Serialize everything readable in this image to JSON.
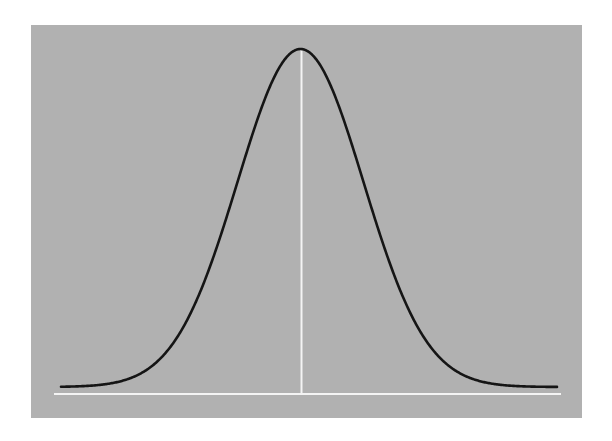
{
  "chart_data": {
    "type": "line",
    "title": "",
    "xlabel": "",
    "ylabel": "",
    "distribution": "normal",
    "mean": 0,
    "std": 1,
    "xlim": [
      -4,
      4
    ],
    "ylim": [
      0,
      0.4
    ],
    "grid": false,
    "legend": null,
    "x": [
      -4,
      -3.5,
      -3,
      -2.5,
      -2,
      -1.5,
      -1,
      -0.5,
      0,
      0.5,
      1,
      1.5,
      2,
      2.5,
      3,
      3.5,
      4
    ],
    "values": [
      0.0001,
      0.0009,
      0.0044,
      0.0175,
      0.054,
      0.1295,
      0.242,
      0.3521,
      0.3989,
      0.3521,
      0.242,
      0.1295,
      0.054,
      0.0175,
      0.0044,
      0.0009,
      0.0001
    ],
    "annotations": [
      {
        "type": "vertical-line",
        "x": 0,
        "label": "mean"
      },
      {
        "type": "baseline",
        "y": 0
      }
    ]
  },
  "colors": {
    "page_background": "#ffffff",
    "panel_background": "#b1b1b1",
    "curve": "#151515",
    "mean_line": "#f4f4f4",
    "baseline": "#f4f4f4"
  },
  "geometry": {
    "center_x": 300.5,
    "baseline_y": 394,
    "curve_base_y": 387,
    "peak_y": 49,
    "sigma_px": 63,
    "x_start": 61,
    "x_end": 557
  }
}
